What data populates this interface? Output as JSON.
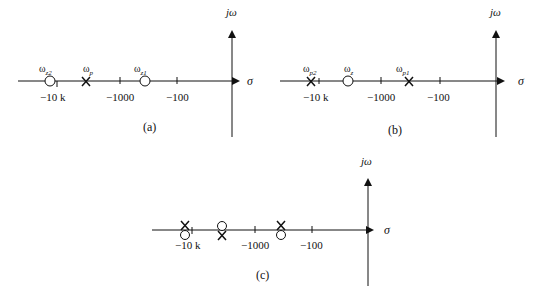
{
  "figure": {
    "panels": [
      {
        "id": "a",
        "caption": "(a)",
        "axis_labels": {
          "real": "σ",
          "imag": "jω"
        },
        "ticks": [
          "−10 k",
          "−1000",
          "−100"
        ],
        "markers": [
          {
            "type": "zero",
            "label": "ω",
            "sub": "z2"
          },
          {
            "type": "pole",
            "label": "ω",
            "sub": "p"
          },
          {
            "type": "zero",
            "label": "ω",
            "sub": "z1"
          }
        ]
      },
      {
        "id": "b",
        "caption": "(b)",
        "axis_labels": {
          "real": "σ",
          "imag": "jω"
        },
        "ticks": [
          "−10 k",
          "−1000",
          "−100"
        ],
        "markers": [
          {
            "type": "pole",
            "label": "ω",
            "sub": "p2"
          },
          {
            "type": "zero",
            "label": "ω",
            "sub": "z"
          },
          {
            "type": "pole",
            "label": "ω",
            "sub": "p1"
          }
        ]
      },
      {
        "id": "c",
        "caption": "(c)",
        "axis_labels": {
          "real": "σ",
          "imag": "jω"
        },
        "ticks": [
          "−10 k",
          "−1000",
          "−100"
        ],
        "markers": [
          {
            "type": "pole-zero pair",
            "arrangement": "pole above zero"
          },
          {
            "type": "pole-zero pair",
            "arrangement": "zero above pole"
          },
          {
            "type": "pole-zero pair",
            "arrangement": "pole above zero"
          }
        ]
      }
    ]
  }
}
